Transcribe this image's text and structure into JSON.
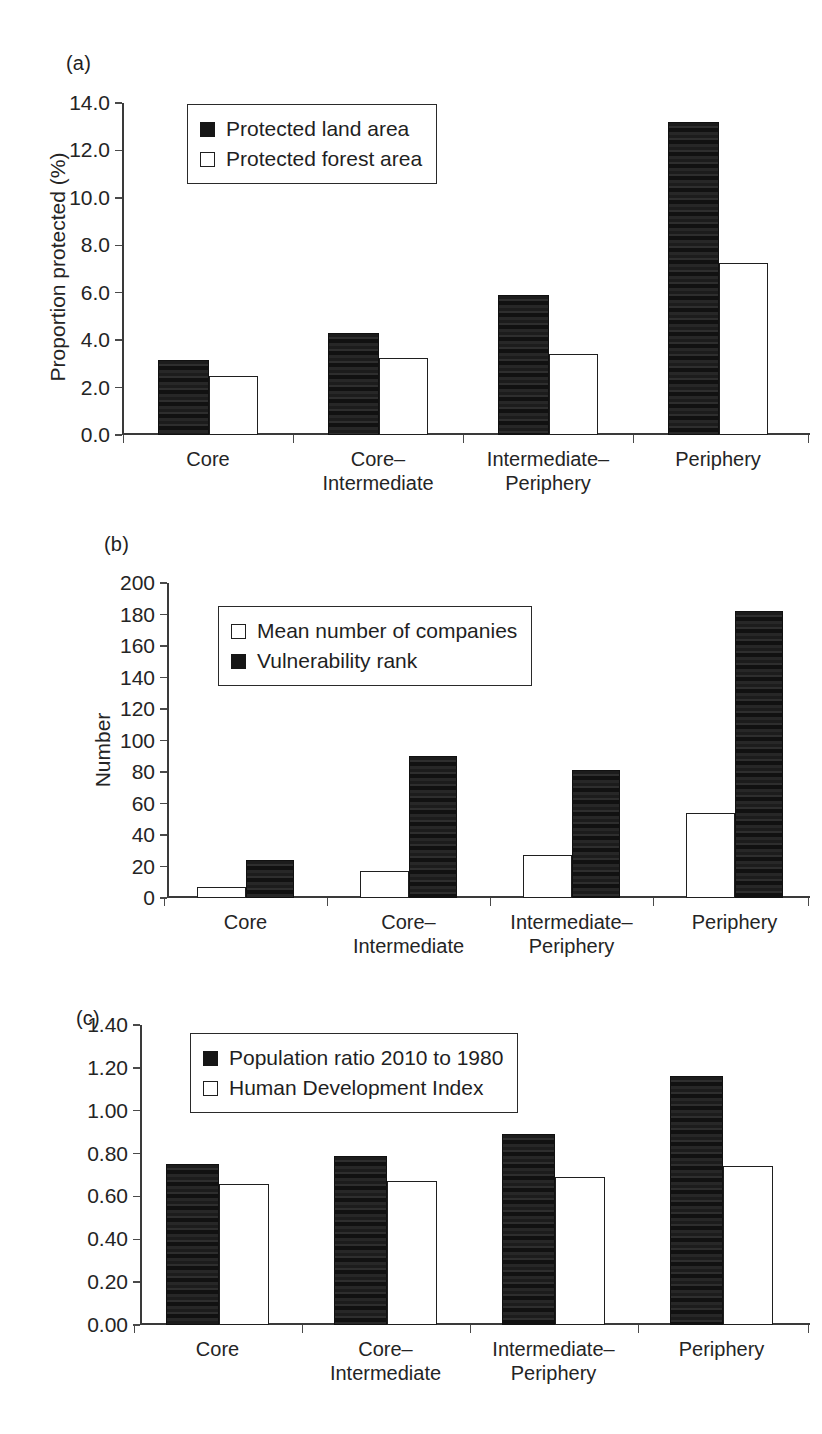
{
  "figure": {
    "panels": [
      "(a)",
      "(b)",
      "(c)"
    ]
  },
  "chart_data": [
    {
      "type": "bar",
      "panel": "(a)",
      "title": "",
      "xlabel": "",
      "ylabel": "Proportion protected (%)",
      "categories": [
        "Core",
        "Core–\nIntermediate",
        "Intermediate–\nPeriphery",
        "Periphery"
      ],
      "ylim": [
        0.0,
        14.0
      ],
      "ytick_labels": [
        "0.0",
        "2.0",
        "4.0",
        "6.0",
        "8.0",
        "10.0",
        "12.0",
        "14.0"
      ],
      "ytick_values": [
        0.0,
        2.0,
        4.0,
        6.0,
        8.0,
        10.0,
        12.0,
        14.0
      ],
      "grid": false,
      "legend_position": "upper-left",
      "series": [
        {
          "name": "Protected land area",
          "fill": "dark",
          "values": [
            3.15,
            4.3,
            5.9,
            13.2
          ]
        },
        {
          "name": "Protected forest area",
          "fill": "light",
          "values": [
            2.5,
            3.25,
            3.4,
            7.25
          ]
        }
      ]
    },
    {
      "type": "bar",
      "panel": "(b)",
      "title": "",
      "xlabel": "",
      "ylabel": "Number",
      "categories": [
        "Core",
        "Core–\nIntermediate",
        "Intermediate–\nPeriphery",
        "Periphery"
      ],
      "ylim": [
        0,
        200
      ],
      "ytick_labels": [
        "0",
        "20",
        "40",
        "60",
        "80",
        "100",
        "120",
        "140",
        "160",
        "180",
        "200"
      ],
      "ytick_values": [
        0,
        20,
        40,
        60,
        80,
        100,
        120,
        140,
        160,
        180,
        200
      ],
      "grid": false,
      "legend_position": "upper-left",
      "series": [
        {
          "name": "Mean number of companies",
          "fill": "light",
          "values": [
            7,
            17,
            27,
            54
          ]
        },
        {
          "name": "Vulnerability rank",
          "fill": "dark",
          "values": [
            24,
            90,
            81,
            182
          ]
        }
      ]
    },
    {
      "type": "bar",
      "panel": "(c)",
      "title": "",
      "xlabel": "",
      "ylabel": "",
      "categories": [
        "Core",
        "Core–\nIntermediate",
        "Intermediate–\nPeriphery",
        "Periphery"
      ],
      "ylim": [
        0.0,
        1.4
      ],
      "ytick_labels": [
        "0.00",
        "0.20",
        "0.40",
        "0.60",
        "0.80",
        "1.00",
        "1.20",
        "1.40"
      ],
      "ytick_values": [
        0.0,
        0.2,
        0.4,
        0.6,
        0.8,
        1.0,
        1.2,
        1.4
      ],
      "grid": false,
      "legend_position": "upper-left",
      "series": [
        {
          "name": "Population ratio 2010 to 1980",
          "fill": "dark",
          "values": [
            0.75,
            0.79,
            0.89,
            1.16
          ]
        },
        {
          "name": "Human Development Index",
          "fill": "light",
          "values": [
            0.66,
            0.67,
            0.69,
            0.74
          ]
        }
      ]
    }
  ]
}
